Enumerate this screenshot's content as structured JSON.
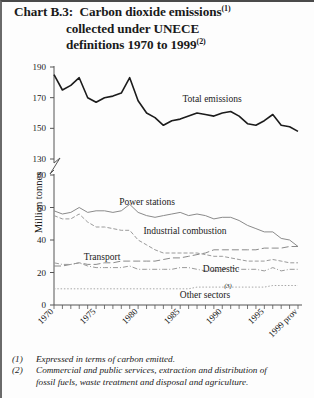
{
  "title": {
    "line1": "Chart B.3:  Carbon dioxide emissions",
    "line1_sup": "(1)",
    "line2": "collected under UNECE",
    "line3": "definitions 1970 to 1999",
    "line3_sup": "(2)"
  },
  "axis": {
    "ylabel": "Million tonnes",
    "yticks_upper": [
      190,
      170,
      150,
      130
    ],
    "yticks_lower": [
      80,
      60,
      40,
      20,
      0
    ],
    "xticks": [
      "1970",
      "1975",
      "1980",
      "1985",
      "1990",
      "1995",
      "1999 prov"
    ]
  },
  "series_labels": {
    "total": "Total emissions",
    "power": "Power stations",
    "industrial": "Industrial combustion",
    "transport": "Transport",
    "domestic": "Domestic",
    "other": "Other sectors",
    "other_sup": "(3)"
  },
  "footnotes": [
    {
      "num": "(1)",
      "text": "Expressed in terms of carbon emitted.",
      "cont": ""
    },
    {
      "num": "(2)",
      "text": "Commercial and public services, extraction and distribution of",
      "cont": "fossil fuels, waste treatment and disposal and agriculture."
    }
  ],
  "chart_data": {
    "type": "line",
    "title": "Chart B.3: Carbon dioxide emissions(1) collected under UNECE definitions 1970 to 1999(2)",
    "xlabel": "",
    "ylabel": "Million tonnes",
    "grid": false,
    "legend": "inline-annotations",
    "axis_break": {
      "lower_range": [
        0,
        80
      ],
      "upper_range": [
        130,
        190
      ]
    },
    "x": [
      1970,
      1971,
      1972,
      1973,
      1974,
      1975,
      1976,
      1977,
      1978,
      1979,
      1980,
      1981,
      1982,
      1983,
      1984,
      1985,
      1986,
      1987,
      1988,
      1989,
      1990,
      1991,
      1992,
      1993,
      1994,
      1995,
      1996,
      1997,
      1998,
      1999
    ],
    "series": [
      {
        "name": "Total emissions",
        "values": [
          185,
          175,
          178,
          183,
          170,
          167,
          170,
          171,
          173,
          183,
          168,
          160,
          157,
          152,
          155,
          156,
          158,
          160,
          159,
          158,
          160,
          161,
          158,
          153,
          152,
          155,
          159,
          152,
          151,
          148
        ]
      },
      {
        "name": "Power stations",
        "values": [
          58,
          56,
          57,
          60,
          57,
          58,
          58,
          57,
          58,
          62,
          57,
          55,
          54,
          55,
          56,
          57,
          55,
          56,
          55,
          53,
          54,
          54,
          52,
          49,
          47,
          45,
          45,
          41,
          40,
          36
        ]
      },
      {
        "name": "Industrial combustion",
        "values": [
          55,
          53,
          53,
          56,
          51,
          48,
          48,
          47,
          46,
          46,
          40,
          37,
          34,
          32,
          32,
          32,
          32,
          32,
          31,
          30,
          30,
          29,
          28,
          27,
          27,
          27,
          28,
          27,
          26,
          26
        ]
      },
      {
        "name": "Transport",
        "values": [
          24,
          24,
          25,
          26,
          25,
          25,
          26,
          26,
          27,
          27,
          27,
          27,
          27,
          28,
          29,
          29,
          30,
          31,
          32,
          34,
          34,
          34,
          34,
          34,
          34,
          35,
          35,
          35,
          36,
          36
        ]
      },
      {
        "name": "Domestic",
        "values": [
          26,
          25,
          25,
          26,
          24,
          23,
          23,
          23,
          23,
          24,
          22,
          22,
          22,
          22,
          22,
          23,
          23,
          22,
          21,
          21,
          22,
          23,
          22,
          22,
          22,
          21,
          23,
          21,
          22,
          22
        ]
      },
      {
        "name": "Other sectors",
        "values": [
          10,
          10,
          10,
          10,
          10,
          10,
          10,
          10,
          10,
          10,
          10,
          10,
          10,
          10,
          10,
          10,
          10,
          11,
          11,
          11,
          11,
          11,
          11,
          11,
          11,
          11,
          12,
          12,
          12,
          12
        ]
      }
    ]
  }
}
